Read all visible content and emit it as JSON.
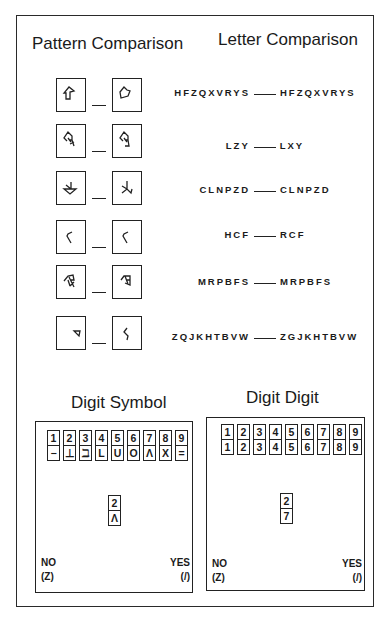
{
  "pattern_comparison": {
    "title": "Pattern Comparison",
    "items": [
      {
        "left": "arrow-house-shape",
        "right": "pentagon-flag-shape"
      },
      {
        "left": "arrow-with-k-stroke",
        "right": "arrow-with-bracket-stroke"
      },
      {
        "left": "down-arrow-triangle",
        "right": "down-arrow-k-stroke"
      },
      {
        "left": "angle-bracket-left",
        "right": "angle-bracket-left"
      },
      {
        "left": "flag-crossed-shape",
        "right": "flag-crossed-shape-variant"
      },
      {
        "left": "small-triangle",
        "right": "hook-stroke"
      }
    ]
  },
  "letter_comparison": {
    "title": "Letter Comparison",
    "items": [
      {
        "left": "HFZQXVRYS",
        "right": "HFZQXVRYS"
      },
      {
        "left": "LZY",
        "right": "LXY"
      },
      {
        "left": "CLNPZD",
        "right": "CLNPZD"
      },
      {
        "left": "HCF",
        "right": "RCF"
      },
      {
        "left": "MRPBFS",
        "right": "MRPBFS"
      },
      {
        "left": "ZQJKHTBVW",
        "right": "ZGJKHTBVW"
      }
    ]
  },
  "digit_symbol": {
    "title": "Digit Symbol",
    "key": [
      {
        "digit": "1",
        "symbol": "−"
      },
      {
        "digit": "2",
        "symbol": "⊥"
      },
      {
        "digit": "3",
        "symbol": "ℶ"
      },
      {
        "digit": "4",
        "symbol": "L"
      },
      {
        "digit": "5",
        "symbol": "U"
      },
      {
        "digit": "6",
        "symbol": "O"
      },
      {
        "digit": "7",
        "symbol": "Λ"
      },
      {
        "digit": "8",
        "symbol": "X"
      },
      {
        "digit": "9",
        "symbol": "="
      }
    ],
    "probe": {
      "top": "2",
      "bottom": "Λ"
    },
    "no_label": "NO",
    "no_key": "(Z)",
    "yes_label": "YES",
    "yes_key": "(/)"
  },
  "digit_digit": {
    "title": "Digit Digit",
    "key": [
      {
        "top": "1",
        "bottom": "1"
      },
      {
        "top": "2",
        "bottom": "2"
      },
      {
        "top": "3",
        "bottom": "3"
      },
      {
        "top": "4",
        "bottom": "4"
      },
      {
        "top": "5",
        "bottom": "5"
      },
      {
        "top": "6",
        "bottom": "6"
      },
      {
        "top": "7",
        "bottom": "7"
      },
      {
        "top": "8",
        "bottom": "8"
      },
      {
        "top": "9",
        "bottom": "9"
      }
    ],
    "probe": {
      "top": "2",
      "bottom": "7"
    },
    "no_label": "NO",
    "no_key": "(Z)",
    "yes_label": "YES",
    "yes_key": "(/)"
  },
  "colors": {
    "ink": "#1a1a1a",
    "background": "#ffffff"
  }
}
